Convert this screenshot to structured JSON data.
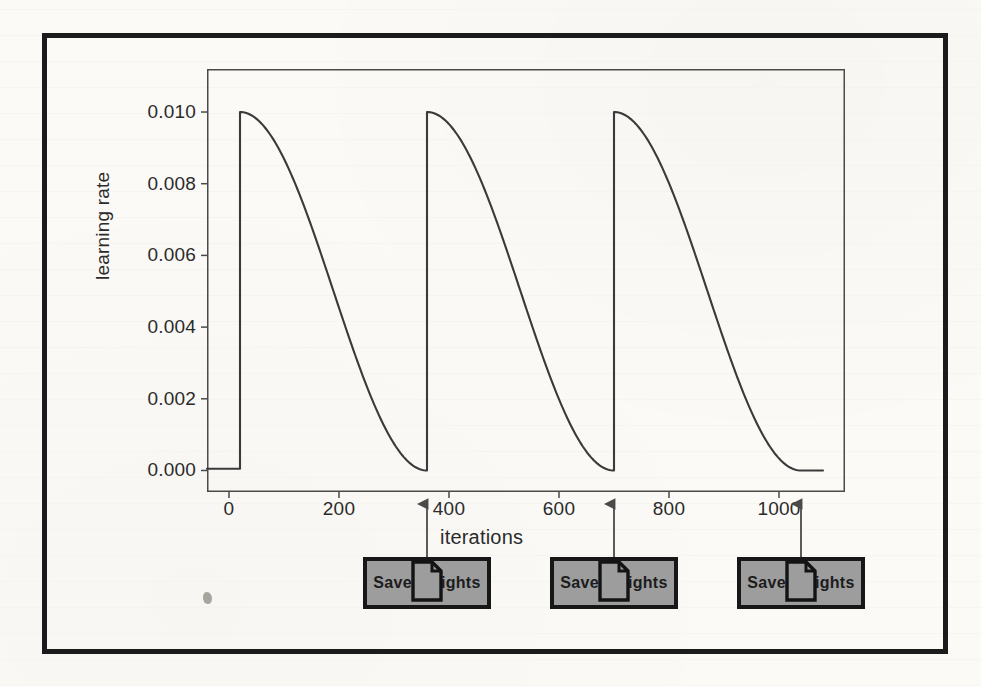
{
  "figure": {
    "background_color": "#fbfaf7",
    "frame_color": "#1b1b1b"
  },
  "chart_data": {
    "type": "line",
    "title": "",
    "subtitle": "",
    "xlabel": "iterations",
    "ylabel": "learning rate",
    "xlim": [
      -40,
      1120
    ],
    "ylim": [
      -0.0006,
      0.0112
    ],
    "xticks": [
      0,
      200,
      400,
      600,
      800,
      1000
    ],
    "xticklabels": [
      "0",
      "200",
      "400",
      "600",
      "800",
      "1000"
    ],
    "yticks": [
      0.0,
      0.002,
      0.004,
      0.006,
      0.008,
      0.01
    ],
    "yticklabels": [
      "0.000",
      "0.002",
      "0.004",
      "0.006",
      "0.008",
      "0.010"
    ],
    "grid": false,
    "legend": null,
    "line_color": "#3a3a3a",
    "line_width": 2,
    "schedule": "cosine-annealing-with-warm-restarts",
    "max_lr": 0.01,
    "min_lr": 0.0,
    "warmup_end": 20,
    "cycle_length": 340,
    "cycle_starts": [
      20,
      360,
      700
    ],
    "cycle_ends": [
      360,
      700,
      1040
    ],
    "series": [
      {
        "name": "learning rate",
        "x": [
          0,
          20,
          20,
          40,
          70,
          100,
          130,
          160,
          190,
          220,
          250,
          280,
          310,
          340,
          360,
          360,
          380,
          410,
          440,
          470,
          500,
          530,
          560,
          590,
          620,
          650,
          680,
          700,
          700,
          720,
          750,
          780,
          810,
          840,
          870,
          900,
          930,
          960,
          990,
          1020,
          1040,
          1080
        ],
        "y": [
          5e-05,
          5e-05,
          0.01,
          0.00998,
          0.00975,
          0.00933,
          0.00876,
          0.00806,
          0.00726,
          0.00639,
          0.00548,
          0.00456,
          0.00366,
          0.00281,
          0.0,
          0.01,
          0.00998,
          0.00975,
          0.00933,
          0.00876,
          0.00806,
          0.00726,
          0.00639,
          0.00548,
          0.00456,
          0.00366,
          0.00281,
          0.0,
          0.01,
          0.00998,
          0.00975,
          0.00933,
          0.00876,
          0.00806,
          0.00726,
          0.00639,
          0.00548,
          0.00456,
          0.00366,
          0.00281,
          0.0,
          0.0
        ]
      }
    ]
  },
  "annotations": {
    "doc_icon_name": "document-icon",
    "boxes": [
      {
        "label": "Save Weights",
        "points_to_iteration": 360
      },
      {
        "label": "Save Weights",
        "points_to_iteration": 700
      },
      {
        "label": "Save Weights",
        "points_to_iteration": 1040
      }
    ]
  }
}
